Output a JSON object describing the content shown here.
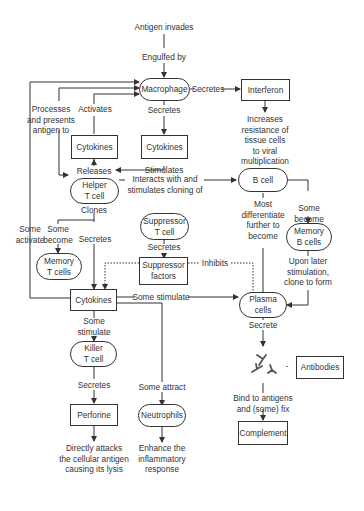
{
  "diagram": {
    "nodes": {
      "antigen_invades": "Antigen invades",
      "macrophage": "Macrophage",
      "interferon": "Interferon",
      "cytokines_top_left": "Cytokines",
      "cytokines_top_right": "Cytokines",
      "helper_t_cell": "Helper\nT cell",
      "b_cell": "B cell",
      "suppressor_t_cell": "Suppressor\nT cell",
      "memory_t_cells": "Memory\nT cells",
      "memory_b_cells": "Memory\nB cells",
      "suppressor_factors": "Suppressor\nfactors",
      "cytokines_center": "Cytokines",
      "plasma_cells": "Plasma\ncells",
      "killer_t_cell": "Killer\nT cell",
      "perforine": "Perforine",
      "neutrophils": "Neutrophils",
      "antibodies": "Antibodies",
      "complement": "Complement"
    },
    "edge_labels": {
      "engulfed_by": "Engulfed by",
      "secretes_interferon": "Secretes",
      "increases_resistance": "Increases\nresistance of\ntissue cells\nto viral\nmultiplication",
      "processes_presents": "Processes\nand presents\nantigen to",
      "activates": "Activates",
      "secretes_macrophage": "Secretes",
      "releases": "Releases",
      "stimulates": "Stimulates",
      "interacts_with": "Interacts with and\nstimulates cloning of",
      "clones": "Clones",
      "some_activate": "Some\nactivate",
      "some_become_t": "Some\nbecome",
      "secretes_helper": "Secretes",
      "secretes_suppressor": "Secretes",
      "inhibits": "Inhibits",
      "most_differentiate": "Most\ndifferentiate\nfurther to\nbecome",
      "some_become_b": "Some\nbecome",
      "upon_later": "Upon later\nstimulation,\nclone to form",
      "some_stimulate_plasma": "Some stimulate",
      "some_stimulate_killer": "Some\nstimulate",
      "secretes_killer": "Secretes",
      "some_attract": "Some attract",
      "secrete_plasma": "Secrete",
      "antibody_dash": "-",
      "bind_to_antigens": "Bind to antigens\nand (some) fix",
      "directly_attacks": "Directly attacks\nthe cellular antigen\ncausing its lysis",
      "enhance_inflammatory": "Enhance the\ninflammatory\nresponse"
    },
    "colors": {
      "line": "#333333",
      "background": "#ffffff"
    }
  }
}
